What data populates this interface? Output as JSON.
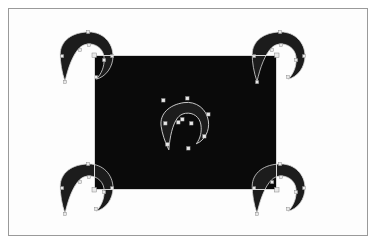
{
  "window": {
    "title": "",
    "frame_color": "#9a9a9a",
    "background_color": "#ffffff"
  },
  "canvas": {
    "name": "artboard",
    "background_color": "#0a0a0a",
    "x": 94,
    "y": 55,
    "width": 183,
    "height": 135
  },
  "palette": {
    "shape_fill": "#1c1c1c",
    "artboard_fill": "#0a0a0a",
    "selection_stroke": "#d8d8d8",
    "anchor_fill": "#e8e8e8",
    "page_background": "#ffffff",
    "frame_border": "#9a9a9a"
  },
  "objects": {
    "center_spiral": {
      "label": "center-spiral",
      "cx": 185,
      "cy": 120,
      "scale": 1.0,
      "rotation": 0,
      "selected": true,
      "anchor_count": 9
    },
    "corner_spirals": [
      {
        "label": "corner-spiral-top-left",
        "cx": 89,
        "cy": 56,
        "rotation": 0,
        "selected": true,
        "anchor_count": 9
      },
      {
        "label": "corner-spiral-top-right",
        "cx": 281,
        "cy": 56,
        "rotation": 0,
        "selected": true,
        "anchor_count": 9
      },
      {
        "label": "corner-spiral-bottom-left",
        "cx": 89,
        "cy": 188,
        "rotation": 0,
        "selected": true,
        "anchor_count": 9
      },
      {
        "label": "corner-spiral-bottom-right",
        "cx": 281,
        "cy": 188,
        "rotation": 0,
        "selected": true,
        "anchor_count": 9
      }
    ]
  },
  "selection": {
    "bbox_visible": true,
    "bbox_stroke": "#d8d8d8",
    "handles_visible": true,
    "object_count": 5
  },
  "status": {
    "tool": "node-editor",
    "zoom": "100%"
  }
}
